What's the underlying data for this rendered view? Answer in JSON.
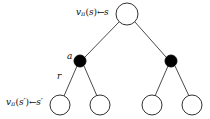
{
  "figure": {
    "name": "policy-evaluation-backup-diagram",
    "background_color": "#ffffff",
    "stroke_color": "#1a1a1a",
    "node_fill_open": "#ffffff",
    "node_fill_filled": "#000000"
  },
  "labels": {
    "root_value": {
      "symbol": "v",
      "subscript": "π",
      "argument": "s",
      "arrow": "←",
      "source": "s",
      "full_text": "vπ(s) ← s"
    },
    "leaf_value": {
      "symbol": "v",
      "subscript": "π",
      "argument": "s′",
      "arrow": "←",
      "source": "s′",
      "full_text": "vπ(s′) ← s′"
    },
    "action": "a",
    "reward": "r"
  },
  "nodes": [
    {
      "id": "root",
      "type": "open",
      "cx": 127,
      "cy": 14,
      "r": 11
    },
    {
      "id": "action-left",
      "type": "filled",
      "cx": 80,
      "cy": 61,
      "r": 6
    },
    {
      "id": "action-right",
      "type": "filled",
      "cx": 171,
      "cy": 61,
      "r": 6
    },
    {
      "id": "leaf-1",
      "type": "open",
      "cx": 60,
      "cy": 105,
      "r": 10
    },
    {
      "id": "leaf-2",
      "type": "open",
      "cx": 100,
      "cy": 105,
      "r": 10
    },
    {
      "id": "leaf-3",
      "type": "open",
      "cx": 152,
      "cy": 105,
      "r": 10
    },
    {
      "id": "leaf-4",
      "type": "open",
      "cx": 192,
      "cy": 105,
      "r": 10
    }
  ],
  "edges": [
    {
      "id": "root-to-action-left",
      "x1": 119,
      "y1": 22,
      "x2": 85,
      "y2": 57
    },
    {
      "id": "root-to-action-right",
      "x1": 135,
      "y1": 22,
      "x2": 166,
      "y2": 57
    },
    {
      "id": "action-left-to-leaf-1",
      "x1": 77,
      "y1": 66,
      "x2": 64,
      "y2": 96
    },
    {
      "id": "action-left-to-leaf-2",
      "x1": 84,
      "y1": 66,
      "x2": 97,
      "y2": 96
    },
    {
      "id": "action-right-to-leaf-3",
      "x1": 168,
      "y1": 66,
      "x2": 155,
      "y2": 96
    },
    {
      "id": "action-right-to-leaf-4",
      "x1": 175,
      "y1": 66,
      "x2": 189,
      "y2": 96
    }
  ]
}
